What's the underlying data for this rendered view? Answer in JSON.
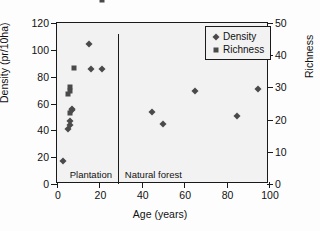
{
  "chart_data": {
    "type": "scatter",
    "title": "",
    "xlabel": "Age (years)",
    "ylabel": "Density (pr/10ha)",
    "ylabel_right": "Richness",
    "xlim": [
      0,
      100
    ],
    "ylim": [
      0,
      120
    ],
    "ylim_right": [
      0,
      50
    ],
    "xticks": [
      0,
      20,
      40,
      60,
      80,
      100
    ],
    "yticks": [
      0,
      20,
      40,
      60,
      80,
      100,
      120
    ],
    "yticks_right": [
      0,
      10,
      20,
      30,
      40,
      50
    ],
    "grid": false,
    "legend_position": "top-right",
    "legend": [
      "Density",
      "Richness"
    ],
    "annotations": [
      {
        "text": "Plantation",
        "x": 6,
        "y": 7
      },
      {
        "text": "Natural forest",
        "x": 32,
        "y": 7
      }
    ],
    "divider": {
      "x": 29,
      "y0": 0,
      "y1": 112
    },
    "series": [
      {
        "name": "Density",
        "marker": "diamond",
        "axis": "left",
        "points": [
          {
            "x": 3,
            "y": 17
          },
          {
            "x": 5,
            "y": 41
          },
          {
            "x": 6,
            "y": 44
          },
          {
            "x": 6,
            "y": 47
          },
          {
            "x": 7,
            "y": 55
          },
          {
            "x": 7,
            "y": 56
          },
          {
            "x": 15,
            "y": 104
          },
          {
            "x": 16,
            "y": 86
          },
          {
            "x": 21,
            "y": 86
          },
          {
            "x": 45,
            "y": 54
          },
          {
            "x": 50,
            "y": 45
          },
          {
            "x": 65,
            "y": 69
          },
          {
            "x": 85,
            "y": 51
          },
          {
            "x": 95,
            "y": 71
          }
        ]
      },
      {
        "name": "Richness",
        "marker": "square",
        "axis": "right",
        "points": [
          {
            "x": 5,
            "y": 28
          },
          {
            "x": 6,
            "y": 22
          },
          {
            "x": 6,
            "y": 29
          },
          {
            "x": 6,
            "y": 30
          },
          {
            "x": 8,
            "y": 36
          },
          {
            "x": 13,
            "y": 65
          },
          {
            "x": 14,
            "y": 85
          },
          {
            "x": 15,
            "y": 87
          },
          {
            "x": 21,
            "y": 57
          },
          {
            "x": 45,
            "y": 60
          },
          {
            "x": 50,
            "y": 77
          },
          {
            "x": 65,
            "y": 99
          },
          {
            "x": 85,
            "y": 65
          },
          {
            "x": 95,
            "y": 78
          }
        ]
      }
    ]
  },
  "colors": {
    "marker": "#4a4a4a",
    "axis": "#1a1a1a",
    "plot_background": "#f2f2f2",
    "figure_background": "#fdfdfd"
  }
}
